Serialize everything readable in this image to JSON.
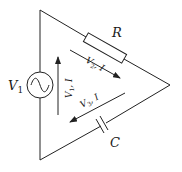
{
  "diagram": {
    "type": "circuit",
    "components": {
      "source": {
        "label": "V",
        "subscript": "1"
      },
      "resistor": {
        "label": "R"
      },
      "capacitor": {
        "label": "C"
      }
    },
    "arrows": {
      "v1": {
        "label": "V",
        "sub": "1",
        "suffix": ", I"
      },
      "v2": {
        "label": "V",
        "sub": "2",
        "suffix": ", I"
      },
      "v3": {
        "label": "V",
        "sub": "3",
        "suffix": ", I"
      }
    },
    "colors": {
      "stroke": "#222222",
      "background": "#ffffff"
    }
  }
}
